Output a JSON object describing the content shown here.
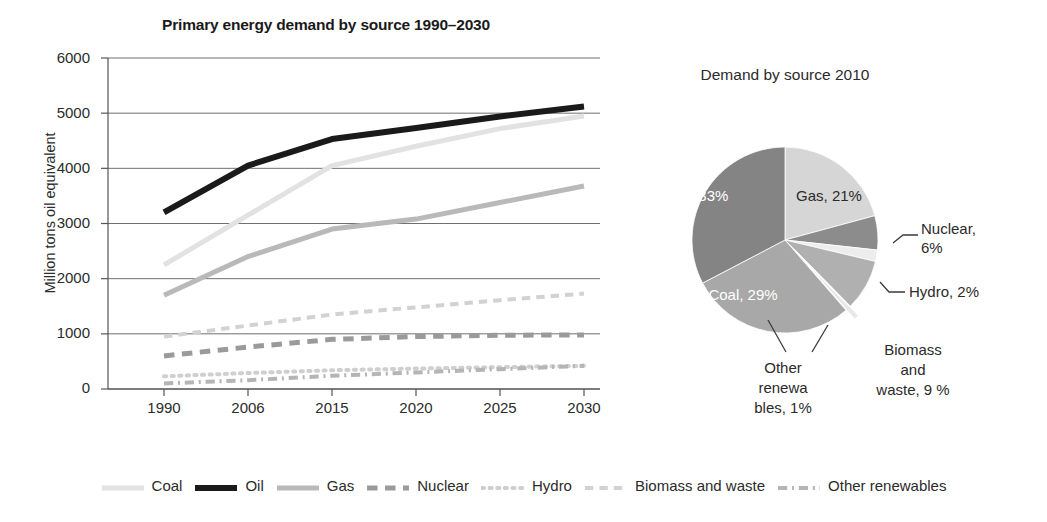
{
  "line_chart": {
    "title": "Primary energy demand by source 1990–2030",
    "ylabel": "Million tons oil equivalent",
    "yticks": [
      "0",
      "1000",
      "2000",
      "3000",
      "4000",
      "5000",
      "6000"
    ],
    "xticks": [
      "1990",
      "2006",
      "2015",
      "2020",
      "2025",
      "2030"
    ]
  },
  "pie_chart": {
    "title": "Demand by source 2010",
    "labels": {
      "oil": "Oil, 33%",
      "gas": "Gas, 21%",
      "coal": "Coal, 29%",
      "nuclear_l1": "Nuclear,",
      "nuclear_l2": "6%",
      "hydro": "Hydro, 2%",
      "biomass_l1": "Biomass",
      "biomass_l2": "and",
      "biomass_l3": "waste, 9 %",
      "other_l1": "Other",
      "other_l2": "renewa",
      "other_l3": "bles, 1%"
    }
  },
  "legend": {
    "items": [
      {
        "label": "Coal",
        "style": "solid",
        "color": "#e2e2e2",
        "thickness": 5
      },
      {
        "label": "Oil",
        "style": "solid",
        "color": "#1a1a1a",
        "thickness": 6
      },
      {
        "label": "Gas",
        "style": "solid",
        "color": "#b9b9b9",
        "thickness": 5
      },
      {
        "label": "Nuclear",
        "style": "dashed",
        "color": "#9a9a9a",
        "thickness": 5
      },
      {
        "label": "Hydro",
        "style": "dotted",
        "color": "#cfcfcf",
        "thickness": 4
      },
      {
        "label": "Biomass and waste",
        "style": "dashed",
        "color": "#d2d2d2",
        "thickness": 4
      },
      {
        "label": "Other renewables",
        "style": "dashdot",
        "color": "#b5b5b5",
        "thickness": 4
      }
    ]
  },
  "chart_data": [
    {
      "type": "line",
      "title": "Primary energy demand by source 1990–2030",
      "xlabel": "",
      "ylabel": "Million tons oil equivalent",
      "categories": [
        "1990",
        "2006",
        "2015",
        "2020",
        "2025",
        "2030"
      ],
      "ylim": [
        0,
        6000
      ],
      "yticks": [
        0,
        1000,
        2000,
        3000,
        4000,
        5000,
        6000
      ],
      "grid": true,
      "legend_position": "bottom",
      "series": [
        {
          "name": "Coal",
          "values": [
            2250,
            3150,
            4050,
            4400,
            4720,
            4950
          ],
          "color": "#e2e2e2",
          "style": "solid"
        },
        {
          "name": "Oil",
          "values": [
            3200,
            4050,
            4530,
            4730,
            4940,
            5120
          ],
          "color": "#1a1a1a",
          "style": "solid"
        },
        {
          "name": "Gas",
          "values": [
            1700,
            2400,
            2900,
            3080,
            3380,
            3680
          ],
          "color": "#b9b9b9",
          "style": "solid"
        },
        {
          "name": "Nuclear",
          "values": [
            600,
            760,
            900,
            950,
            975,
            980
          ],
          "color": "#9a9a9a",
          "style": "dashed"
        },
        {
          "name": "Hydro",
          "values": [
            230,
            290,
            340,
            370,
            395,
            420
          ],
          "color": "#cfcfcf",
          "style": "dotted"
        },
        {
          "name": "Biomass and waste",
          "values": [
            950,
            1150,
            1350,
            1480,
            1610,
            1730
          ],
          "color": "#d2d2d2",
          "style": "dashed"
        },
        {
          "name": "Other renewables",
          "values": [
            100,
            160,
            240,
            300,
            360,
            420
          ],
          "color": "#b5b5b5",
          "style": "dashdot"
        }
      ]
    },
    {
      "type": "pie",
      "title": "Demand by source 2010",
      "categories": [
        "Gas",
        "Nuclear",
        "Hydro",
        "Biomass and waste",
        "Other renewables",
        "Coal",
        "Oil"
      ],
      "values": [
        21,
        6,
        2,
        9,
        1,
        29,
        33
      ],
      "unit": "%",
      "colors": [
        "#d6d6d6",
        "#8c8c8c",
        "#ededed",
        "#b0b0b0",
        "#e8e8e8",
        "#a8a8a8",
        "#848484"
      ],
      "exploded": [
        "Other renewables"
      ],
      "legend_position": "labels"
    }
  ]
}
